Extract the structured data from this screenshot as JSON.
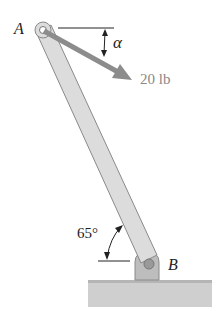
{
  "diagram": {
    "point_a_label": "A",
    "point_b_label": "B",
    "force_label": "20 lb",
    "angle_force_label": "α",
    "angle_rod_label": "65°",
    "colors": {
      "rod": "#d6d6d6",
      "rod_edge": "#8a8a8a",
      "arrow": "#8c8c8c",
      "ground": "#c8c8c8",
      "text": "#222222",
      "force_text": "#888888"
    }
  }
}
